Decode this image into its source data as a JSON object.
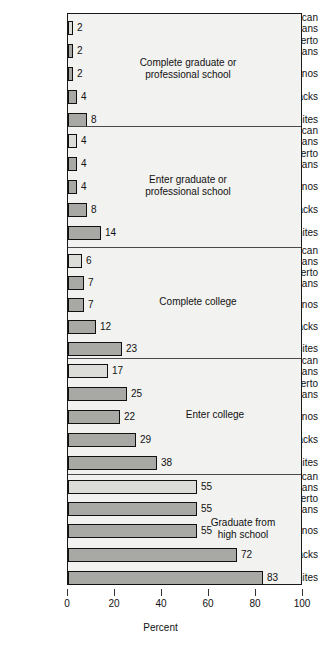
{
  "chart_data": {
    "type": "bar",
    "title": "",
    "xlabel": "Percent",
    "ylabel": "",
    "xlim": [
      0,
      100
    ],
    "orientation": "horizontal",
    "grid": false,
    "legend": "none",
    "xticks": [
      "0",
      "20",
      "40",
      "60",
      "80",
      "100"
    ],
    "categories": [
      "American Indians",
      "Puerto Ricans",
      "Chicanos",
      "Blacks",
      "Whites"
    ],
    "panels": [
      {
        "title_line1": "Complete graduate or",
        "title_line2": "professional school",
        "values": [
          2,
          2,
          2,
          4,
          8
        ]
      },
      {
        "title_line1": "Enter graduate or",
        "title_line2": "professional school",
        "values": [
          4,
          4,
          4,
          8,
          14
        ]
      },
      {
        "title_line1": "Complete college",
        "title_line2": "",
        "values": [
          6,
          7,
          7,
          12,
          23
        ]
      },
      {
        "title_line1": "Enter college",
        "title_line2": "",
        "values": [
          17,
          25,
          22,
          29,
          38
        ]
      },
      {
        "title_line1": "Graduate from",
        "title_line2": "high school",
        "values": [
          55,
          55,
          55,
          72,
          83
        ]
      }
    ]
  },
  "labels": {
    "american_indians_l1": "American",
    "american_indians_l2": "Indians",
    "puerto_ricans_l1": "Puerto",
    "puerto_ricans_l2": "Ricans",
    "chicanos": "Chicanos",
    "blacks": "Blacks",
    "whites": "Whites"
  },
  "axis": {
    "title": "Percent",
    "tick_0": "0",
    "tick_20": "20",
    "tick_40": "40",
    "tick_60": "60",
    "tick_80": "80",
    "tick_100": "100"
  },
  "panel_titles": {
    "p0_l1": "Complete graduate or",
    "p0_l2": "professional school",
    "p1_l1": "Enter graduate or",
    "p1_l2": "professional school",
    "p2_l1": "Complete college",
    "p3_l1": "Enter college",
    "p4_l1": "Graduate from",
    "p4_l2": "high school"
  },
  "values": {
    "p0": [
      "2",
      "2",
      "2",
      "4",
      "8"
    ],
    "p1": [
      "4",
      "4",
      "4",
      "8",
      "14"
    ],
    "p2": [
      "6",
      "7",
      "7",
      "12",
      "23"
    ],
    "p3": [
      "17",
      "25",
      "22",
      "29",
      "38"
    ],
    "p4": [
      "55",
      "55",
      "55",
      "72",
      "83"
    ]
  },
  "colors": {
    "bar_light": "#dcdcd8",
    "bar_mid": "#a8a8a4",
    "bar_border": "#111111",
    "panel_bg": "#f2f2f0",
    "frame": "#1a1a1a"
  }
}
